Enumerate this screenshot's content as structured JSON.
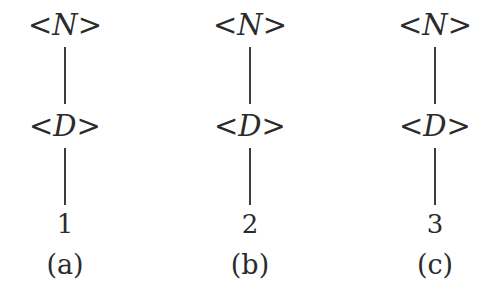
{
  "figure": {
    "background_color": "#ffffff",
    "ink_color": "#2b2b2b",
    "edge_color": "#3d3d3d",
    "trees": [
      {
        "id": "a",
        "root": "<N>",
        "child": "<D>",
        "leaf": "1",
        "caption": "(a)"
      },
      {
        "id": "b",
        "root": "<N>",
        "child": "<D>",
        "leaf": "2",
        "caption": "(b)"
      },
      {
        "id": "c",
        "root": "<N>",
        "child": "<D>",
        "leaf": "3",
        "caption": "(c)"
      }
    ]
  }
}
